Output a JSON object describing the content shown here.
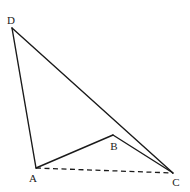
{
  "diagram": {
    "type": "geometry-figure",
    "points": {
      "A": {
        "label": "A",
        "x": 36,
        "y": 168,
        "label_x": 33,
        "label_y": 182
      },
      "B": {
        "label": "B",
        "x": 113,
        "y": 135,
        "label_x": 114,
        "label_y": 150
      },
      "C": {
        "label": "C",
        "x": 173,
        "y": 173,
        "label_x": 176,
        "label_y": 186
      },
      "D": {
        "label": "D",
        "x": 12,
        "y": 28,
        "label_x": 11,
        "label_y": 24
      }
    },
    "segments": [
      {
        "from": "D",
        "to": "A",
        "style": "solid"
      },
      {
        "from": "D",
        "to": "C",
        "style": "solid"
      },
      {
        "from": "A",
        "to": "B",
        "style": "solid"
      },
      {
        "from": "B",
        "to": "C",
        "style": "solid"
      },
      {
        "from": "A",
        "to": "C",
        "style": "dashed"
      }
    ],
    "colors": {
      "stroke": "#1a1a1a",
      "background": "#ffffff",
      "label": "#222222"
    }
  }
}
